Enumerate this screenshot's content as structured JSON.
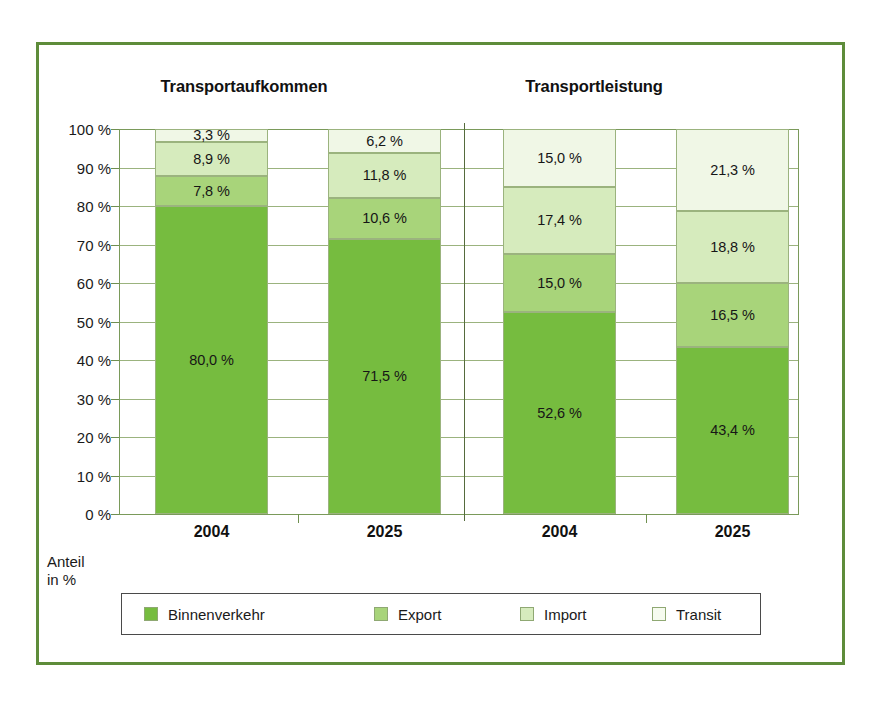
{
  "chart_data": {
    "type": "bar",
    "subtype": "stacked-100-percent",
    "title": "",
    "panels": [
      {
        "title": "Transportaufkommen",
        "categories": [
          "2004",
          "2025"
        ]
      },
      {
        "title": "Transportleistung",
        "categories": [
          "2004",
          "2025"
        ]
      }
    ],
    "categories": [
      "2004",
      "2025",
      "2004",
      "2025"
    ],
    "series": [
      {
        "name": "Binnenverkehr",
        "color": "#76bc3f",
        "values": [
          80.0,
          71.5,
          52.6,
          43.4
        ],
        "labels": [
          "80,0 %",
          "71,5 %",
          "52,6 %",
          "43,4 %"
        ]
      },
      {
        "name": "Export",
        "color": "#a8d47a",
        "values": [
          7.8,
          10.6,
          15.0,
          16.5
        ],
        "labels": [
          "7,8 %",
          "10,6 %",
          "15,0 %",
          "16,5 %"
        ]
      },
      {
        "name": "Import",
        "color": "#d6ebbd",
        "values": [
          8.9,
          11.8,
          17.4,
          18.8
        ],
        "labels": [
          "8,9 %",
          "11,8 %",
          "17,4 %",
          "18,8 %"
        ]
      },
      {
        "name": "Transit",
        "color": "#f0f7e6",
        "values": [
          3.3,
          6.2,
          15.0,
          21.3
        ],
        "labels": [
          "3,3 %",
          "6,2 %",
          "15,0 %",
          "21,3 %"
        ]
      }
    ],
    "ylabel": "Anteil in %",
    "ylim": [
      0,
      100
    ],
    "ytick_labels": [
      "100 %",
      "90 %",
      "80 %",
      "70 %",
      "60 %",
      "50 %",
      "40 %",
      "30 %",
      "20 %",
      "10 %",
      "0 %"
    ],
    "ytick_values": [
      100,
      90,
      80,
      70,
      60,
      50,
      40,
      30,
      20,
      10,
      0
    ],
    "grid": true,
    "legend_position": "bottom"
  },
  "panels": {
    "left_title": "Transportaufkommen",
    "right_title": "Transportleistung"
  },
  "axis": {
    "caption_line1": "Anteil",
    "caption_line2": "in %",
    "y_ticks": [
      {
        "label": "100 %",
        "value": 100
      },
      {
        "label": "90 %",
        "value": 90
      },
      {
        "label": "80 %",
        "value": 80
      },
      {
        "label": "70 %",
        "value": 70
      },
      {
        "label": "60 %",
        "value": 60
      },
      {
        "label": "50 %",
        "value": 50
      },
      {
        "label": "40 %",
        "value": 40
      },
      {
        "label": "30 %",
        "value": 30
      },
      {
        "label": "20 %",
        "value": 20
      },
      {
        "label": "10 %",
        "value": 10
      },
      {
        "label": "0 %",
        "value": 0
      }
    ],
    "x_categories": [
      "2004",
      "2025",
      "2004",
      "2025"
    ]
  },
  "bars": [
    {
      "category": "2004",
      "panel": "Transportaufkommen",
      "segments": [
        {
          "series": "Transit",
          "label": "3,3 %",
          "value": 3.3,
          "color": "#f0f7e6"
        },
        {
          "series": "Import",
          "label": "8,9 %",
          "value": 8.9,
          "color": "#d6ebbd"
        },
        {
          "series": "Export",
          "label": "7,8 %",
          "value": 7.8,
          "color": "#a8d47a"
        },
        {
          "series": "Binnenverkehr",
          "label": "80,0 %",
          "value": 80.0,
          "color": "#76bc3f"
        }
      ]
    },
    {
      "category": "2025",
      "panel": "Transportaufkommen",
      "segments": [
        {
          "series": "Transit",
          "label": "6,2 %",
          "value": 6.2,
          "color": "#f0f7e6"
        },
        {
          "series": "Import",
          "label": "11,8 %",
          "value": 11.8,
          "color": "#d6ebbd"
        },
        {
          "series": "Export",
          "label": "10,6 %",
          "value": 10.6,
          "color": "#a8d47a"
        },
        {
          "series": "Binnenverkehr",
          "label": "71,5 %",
          "value": 71.5,
          "color": "#76bc3f"
        }
      ]
    },
    {
      "category": "2004",
      "panel": "Transportleistung",
      "segments": [
        {
          "series": "Transit",
          "label": "15,0 %",
          "value": 15.0,
          "color": "#f0f7e6"
        },
        {
          "series": "Import",
          "label": "17,4 %",
          "value": 17.4,
          "color": "#d6ebbd"
        },
        {
          "series": "Export",
          "label": "15,0 %",
          "value": 15.0,
          "color": "#a8d47a"
        },
        {
          "series": "Binnenverkehr",
          "label": "52,6 %",
          "value": 52.6,
          "color": "#76bc3f"
        }
      ]
    },
    {
      "category": "2025",
      "panel": "Transportleistung",
      "segments": [
        {
          "series": "Transit",
          "label": "21,3 %",
          "value": 21.3,
          "color": "#f0f7e6"
        },
        {
          "series": "Import",
          "label": "18,8 %",
          "value": 18.8,
          "color": "#d6ebbd"
        },
        {
          "series": "Export",
          "label": "16,5 %",
          "value": 16.5,
          "color": "#a8d47a"
        },
        {
          "series": "Binnenverkehr",
          "label": "43,4 %",
          "value": 43.4,
          "color": "#76bc3f"
        }
      ]
    }
  ],
  "legend": {
    "items": [
      {
        "label": "Binnenverkehr",
        "color": "#76bc3f"
      },
      {
        "label": "Export",
        "color": "#a8d47a"
      },
      {
        "label": "Import",
        "color": "#d6ebbd"
      },
      {
        "label": "Transit",
        "color": "#f6fbef"
      }
    ]
  },
  "colors": {
    "frame": "#5e8c3a",
    "grid": "#9bb37e",
    "axis": "#7a9a5a",
    "divider": "#556b3d",
    "legend_border": "#4a4a4a",
    "binnenverkehr": "#76bc3f",
    "export": "#a8d47a",
    "import": "#d6ebbd",
    "transit": "#f6fbef"
  }
}
